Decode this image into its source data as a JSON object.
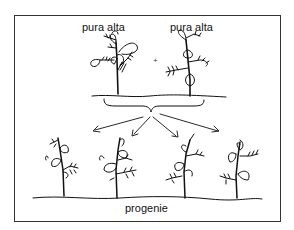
{
  "diagram": {
    "type": "genetic-cross",
    "parents": [
      {
        "label": "pura alta"
      },
      {
        "label": "pura alta"
      }
    ],
    "cross_symbol": "+",
    "offspring_label": "progenie",
    "offspring_count": 4,
    "arrow_count": 4,
    "colors": {
      "line": "#111111",
      "arrow": "#555555",
      "background": "#ffffff"
    }
  }
}
